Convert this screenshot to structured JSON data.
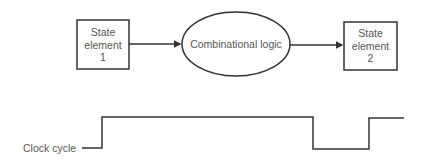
{
  "diagram": {
    "state_element_1": {
      "lines": [
        "State",
        "element",
        "1"
      ]
    },
    "combinational_logic": {
      "label": "Combinational logic"
    },
    "state_element_2": {
      "lines": [
        "State",
        "element",
        "2"
      ]
    },
    "clock": {
      "label": "Clock cycle"
    },
    "colors": {
      "stroke": "#333333",
      "text": "#555555"
    }
  }
}
